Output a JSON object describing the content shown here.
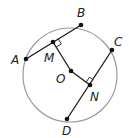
{
  "diagram": {
    "type": "geometry-circle",
    "colors": {
      "circle": "#9a9a9a",
      "segment": "#1a1a1a",
      "point": "#111111",
      "label": "#222222"
    },
    "circle": {
      "cx": 70,
      "cy": 75,
      "r": 47,
      "center_label": "O"
    },
    "points": [
      {
        "id": "A",
        "label": "A",
        "x": 26,
        "y": 59,
        "lx": 11,
        "ly": 64
      },
      {
        "id": "B",
        "label": "B",
        "x": 81,
        "y": 25,
        "lx": 77,
        "ly": 17
      },
      {
        "id": "C",
        "label": "C",
        "x": 112,
        "y": 50,
        "lx": 114,
        "ly": 46
      },
      {
        "id": "D",
        "label": "D",
        "x": 67,
        "y": 119,
        "lx": 62,
        "ly": 135
      },
      {
        "id": "M",
        "label": "M",
        "x": 53,
        "y": 42,
        "lx": 44,
        "ly": 62
      },
      {
        "id": "O",
        "label": "O",
        "x": 71,
        "y": 71,
        "lx": 56,
        "ly": 83
      },
      {
        "id": "N",
        "label": "N",
        "x": 90,
        "y": 85,
        "lx": 90,
        "ly": 101
      }
    ],
    "segments": [
      {
        "from": "A",
        "to": "B"
      },
      {
        "from": "C",
        "to": "D"
      },
      {
        "from": "M",
        "to": "O"
      },
      {
        "from": "O",
        "to": "N"
      }
    ],
    "right_angles": [
      {
        "at": "M",
        "between": [
          "B",
          "O"
        ]
      },
      {
        "at": "N",
        "between": [
          "C",
          "O"
        ]
      }
    ]
  }
}
